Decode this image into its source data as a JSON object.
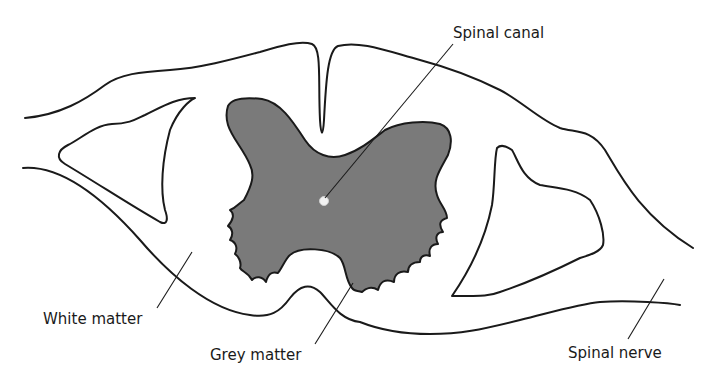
{
  "diagram": {
    "type": "anatomical cross-section",
    "labels": {
      "spinal_canal": "Spinal canal",
      "white_matter": "White matter",
      "grey_matter": "Grey matter",
      "spinal_nerve": "Spinal nerve"
    },
    "colors": {
      "grey_matter_fill": "#7a7a7a",
      "outline": "#1a1a1a",
      "background": "#ffffff"
    }
  }
}
